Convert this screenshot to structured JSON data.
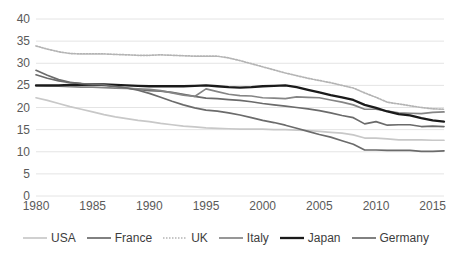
{
  "chart_data": {
    "type": "line",
    "title": "",
    "subtitle": "",
    "xlabel": "",
    "ylabel": "",
    "xlim": [
      1980,
      2016
    ],
    "ylim": [
      0,
      40
    ],
    "ytick_step": 5,
    "yticks": [
      "0",
      "5",
      "10",
      "15",
      "20",
      "25",
      "30",
      "35",
      "40"
    ],
    "xticks": [
      "1980",
      "1985",
      "1990",
      "1995",
      "2000",
      "2005",
      "2010",
      "2015"
    ],
    "grid": "horizontal",
    "legend_position": "bottom",
    "x": [
      1980,
      1981,
      1982,
      1983,
      1984,
      1985,
      1986,
      1987,
      1988,
      1989,
      1990,
      1991,
      1992,
      1993,
      1994,
      1995,
      1996,
      1997,
      1998,
      1999,
      2000,
      2001,
      2002,
      2003,
      2004,
      2005,
      2006,
      2007,
      2008,
      2009,
      2010,
      2011,
      2012,
      2013,
      2014,
      2015,
      2016
    ],
    "series": [
      {
        "name": "USA",
        "color": "#c8c8c8",
        "width": 1.7,
        "dash": "none",
        "values": [
          22.2,
          21.6,
          20.9,
          20.2,
          19.6,
          19.0,
          18.4,
          17.9,
          17.5,
          17.1,
          16.8,
          16.4,
          16.1,
          15.8,
          15.6,
          15.4,
          15.3,
          15.2,
          15.1,
          15.1,
          15.1,
          15.0,
          15.0,
          14.9,
          14.8,
          14.6,
          14.4,
          14.2,
          13.8,
          13.1,
          13.1,
          12.9,
          12.7,
          12.7,
          12.7,
          12.6,
          12.6
        ]
      },
      {
        "name": "France",
        "color": "#6b6b6b",
        "width": 1.7,
        "dash": "none",
        "values": [
          27.4,
          26.6,
          26.0,
          25.6,
          25.4,
          25.2,
          25.0,
          24.7,
          24.4,
          24.1,
          23.8,
          23.7,
          23.4,
          23.0,
          22.5,
          22.1,
          22.0,
          21.8,
          21.6,
          21.3,
          20.9,
          20.6,
          20.3,
          20.0,
          19.7,
          19.3,
          18.8,
          18.2,
          17.7,
          16.3,
          16.8,
          16.0,
          16.1,
          16.1,
          15.7,
          15.8,
          15.7
        ]
      },
      {
        "name": "UK",
        "color": "#b4b4b4",
        "width": 1.7,
        "dash": "dotted",
        "values": [
          33.9,
          33.2,
          32.6,
          32.2,
          32.1,
          32.1,
          32.1,
          32.0,
          31.9,
          31.8,
          31.8,
          31.9,
          31.8,
          31.7,
          31.6,
          31.6,
          31.6,
          31.2,
          30.6,
          29.9,
          29.2,
          28.5,
          27.8,
          27.2,
          26.6,
          26.1,
          25.6,
          25.0,
          24.4,
          23.3,
          22.3,
          21.2,
          20.8,
          20.4,
          20.0,
          19.7,
          19.6
        ]
      },
      {
        "name": "Italy",
        "color": "#858585",
        "width": 1.7,
        "dash": "none",
        "values": [
          24.9,
          24.8,
          24.8,
          24.7,
          24.6,
          24.6,
          24.5,
          24.4,
          24.3,
          24.2,
          24.1,
          23.8,
          23.3,
          22.8,
          22.5,
          24.2,
          23.6,
          23.0,
          22.7,
          22.6,
          22.2,
          22.1,
          22.0,
          22.4,
          22.3,
          22.2,
          21.7,
          21.2,
          20.6,
          19.6,
          19.6,
          19.2,
          18.8,
          18.7,
          18.6,
          18.9,
          19.0
        ]
      },
      {
        "name": "Japan",
        "color": "#1a1a1a",
        "width": 2.3,
        "dash": "none",
        "values": [
          25.0,
          25.0,
          25.0,
          25.1,
          25.1,
          25.2,
          25.2,
          25.1,
          25.0,
          24.9,
          24.8,
          24.8,
          24.8,
          24.8,
          24.9,
          25.0,
          24.8,
          24.6,
          24.5,
          24.6,
          24.8,
          24.9,
          25.0,
          24.6,
          24.0,
          23.4,
          22.8,
          22.3,
          21.7,
          20.6,
          19.9,
          19.1,
          18.5,
          18.2,
          17.6,
          17.1,
          16.8
        ]
      },
      {
        "name": "Germany",
        "color": "#6b6b6b",
        "width": 1.7,
        "dash": "none",
        "values": [
          28.4,
          27.3,
          26.3,
          25.7,
          25.4,
          25.3,
          25.1,
          24.8,
          24.4,
          23.9,
          23.2,
          22.3,
          21.4,
          20.6,
          19.9,
          19.4,
          19.2,
          18.8,
          18.3,
          17.7,
          17.1,
          16.6,
          16.0,
          15.3,
          14.6,
          13.9,
          13.3,
          12.5,
          11.7,
          10.4,
          10.4,
          10.3,
          10.3,
          10.3,
          10.1,
          10.1,
          10.2
        ]
      }
    ]
  },
  "legend": {
    "items": [
      {
        "label": "USA"
      },
      {
        "label": "France"
      },
      {
        "label": "UK"
      },
      {
        "label": "Italy"
      },
      {
        "label": "Japan"
      },
      {
        "label": "Germany"
      }
    ]
  },
  "colors": {
    "background": "#ffffff",
    "gridline": "#e4e4e4",
    "axis_text": "#5a5a5a",
    "legend_text": "#3d3d3d"
  }
}
